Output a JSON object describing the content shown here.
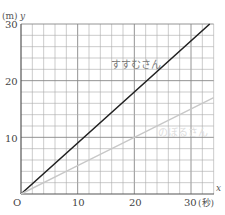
{
  "chart_data": {
    "type": "line",
    "title": "",
    "xlabel": "x",
    "ylabel": "y",
    "x_unit": "(秒)",
    "y_unit": "(m)",
    "origin_label": "O",
    "xlim": [
      0,
      34
    ],
    "ylim": [
      0,
      30
    ],
    "x_ticks": [
      10,
      20,
      30
    ],
    "y_ticks": [
      10,
      20,
      30
    ],
    "grid": true,
    "grid_step_x": 2,
    "grid_step_y": 2,
    "series": [
      {
        "name": "すすむさん",
        "color": "#222222",
        "x": [
          0,
          10,
          20,
          33.3
        ],
        "y": [
          0,
          9,
          18,
          30
        ],
        "slope": 0.9
      },
      {
        "name": "のぼるさん",
        "color": "#c8c8c8",
        "x": [
          0,
          10,
          20,
          34
        ],
        "y": [
          0,
          5,
          10,
          17
        ],
        "slope": 0.5
      }
    ],
    "legend": "inline labels on lines"
  },
  "labels": {
    "y_unit": "(m)",
    "y_var": "y",
    "x_var": "x",
    "x_unit": "(秒)",
    "origin": "O",
    "y_ticks": [
      "10",
      "20",
      "30"
    ],
    "x_ticks": [
      "10",
      "20",
      "30"
    ],
    "series_1": "すすむさん",
    "series_2": "のぼるさん"
  }
}
